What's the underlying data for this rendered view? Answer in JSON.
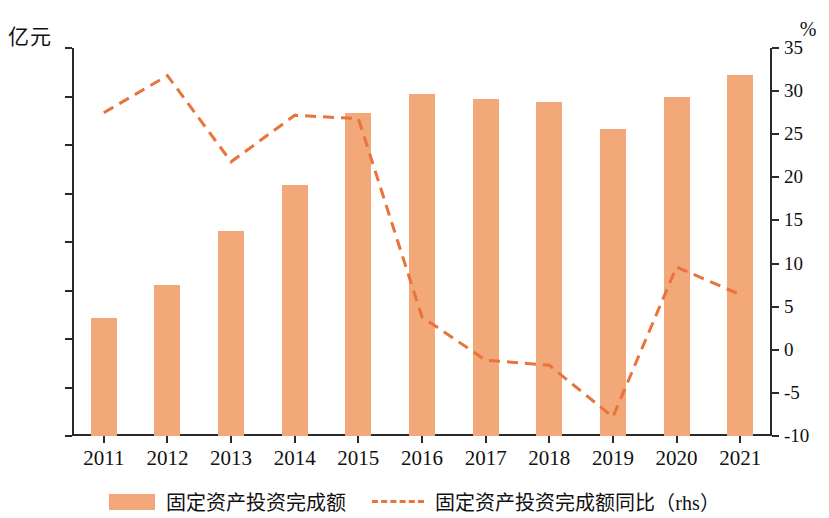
{
  "axis": {
    "left_unit": "亿元",
    "right_unit": "%",
    "left_ticks": [
      "0",
      "1000",
      "2000",
      "3000",
      "4000",
      "5000",
      "6000",
      "7000",
      "8000"
    ],
    "right_ticks": [
      "-10",
      "-5",
      "0",
      "5",
      "10",
      "15",
      "20",
      "25",
      "30",
      "35"
    ]
  },
  "legend": {
    "bar_label": "固定资产投资完成额",
    "line_label": "固定资产投资完成额同比（rhs）"
  },
  "colors": {
    "bar": "#f2a878",
    "line": "#e8743b",
    "axis": "#2a2a2a"
  },
  "chart_data": {
    "type": "bar",
    "title": "",
    "xlabel": "",
    "ylabel": "亿元",
    "categories": [
      "2011",
      "2012",
      "2013",
      "2014",
      "2015",
      "2016",
      "2017",
      "2018",
      "2019",
      "2020",
      "2021"
    ],
    "ylim": [
      0,
      8000
    ],
    "y2lim": [
      -10,
      35
    ],
    "y2label": "%",
    "grid": false,
    "legend_position": "bottom",
    "series": [
      {
        "name": "固定资产投资完成额",
        "type": "bar",
        "axis": "left",
        "unit": "亿元",
        "values": [
          2430,
          3120,
          4220,
          5180,
          6650,
          7050,
          6940,
          6880,
          6340,
          6980,
          7440
        ]
      },
      {
        "name": "固定资产投资完成额同比（rhs）",
        "type": "line",
        "axis": "right",
        "unit": "%",
        "style": "dashed",
        "values": [
          27.5,
          31.8,
          21.8,
          27.2,
          26.8,
          3.8,
          -1.2,
          -1.8,
          -7.8,
          9.6,
          6.4
        ]
      }
    ]
  }
}
